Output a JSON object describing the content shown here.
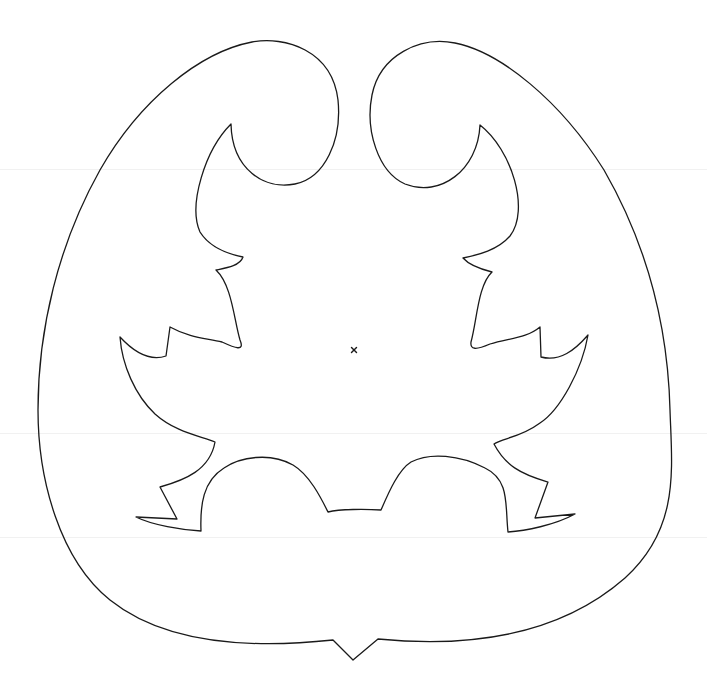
{
  "figure": {
    "stroke_color": "#1a1a1a",
    "background_color": "#ffffff",
    "guide_color": "#f1f1f1",
    "center_mark": "×",
    "center_mark_position": [
      354,
      350
    ],
    "symmetry_axis_x": 353.5,
    "guide_lines_y": [
      169,
      433,
      537
    ]
  }
}
